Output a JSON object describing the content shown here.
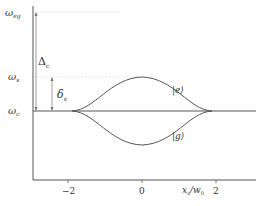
{
  "diagram": {
    "y_labels": {
      "omega_eg": "ω",
      "omega_eg_sub": "eg",
      "omega_s": "ω",
      "omega_s_sub": "s",
      "omega_c": "ω",
      "omega_c_sub": "c"
    },
    "gap_labels": {
      "Delta": "Δ",
      "Delta_sub": "c",
      "delta": "δ",
      "delta_sub": "s"
    },
    "state_labels": {
      "excited": "|e⟩",
      "ground": "|g⟩"
    },
    "x_axis": {
      "ticks": [
        "−2",
        "0",
        "2"
      ],
      "label": "x",
      "label_sub": "a",
      "label_den": "/w",
      "label_den_sub": "0"
    },
    "colors": {
      "axis": "#555555",
      "curve": "#555555",
      "dotted": "#cccccc"
    }
  }
}
